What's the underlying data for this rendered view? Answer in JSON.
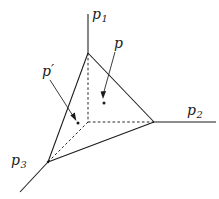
{
  "figure": {
    "kind": "geometric-diagram",
    "background_color": "#ffffff",
    "stroke_color": "#1a1a1a"
  },
  "axes": [
    {
      "id": "p1",
      "base": "p",
      "subscript": "1",
      "orientation": "vertical-up",
      "label_position": {
        "x": 92,
        "y": 7
      }
    },
    {
      "id": "p2",
      "base": "p",
      "subscript": "2",
      "orientation": "horizontal-right",
      "label_position": {
        "x": 187,
        "y": 103
      }
    },
    {
      "id": "p3",
      "base": "p",
      "subscript": "3",
      "orientation": "diagonal-down-left",
      "label_position": {
        "x": 11,
        "y": 153
      }
    }
  ],
  "points": [
    {
      "id": "p",
      "label": "p",
      "prime": false,
      "dot": {
        "x": 104,
        "y": 103
      },
      "label_position": {
        "x": 114,
        "y": 36
      },
      "leader_from": {
        "x": 115,
        "y": 52
      },
      "leader_to": {
        "x": 103,
        "y": 95
      }
    },
    {
      "id": "p-prime",
      "label": "p",
      "prime": true,
      "dot": {
        "x": 78,
        "y": 123
      },
      "label_position": {
        "x": 42,
        "y": 64
      },
      "leader_from": {
        "x": 50,
        "y": 80
      },
      "leader_to": {
        "x": 75,
        "y": 119
      }
    }
  ],
  "vertices": {
    "apex": {
      "x": 88,
      "y": 53
    },
    "right": {
      "x": 154,
      "y": 122
    },
    "bottom_left": {
      "x": 48,
      "y": 162
    },
    "hidden_back": {
      "x": 88,
      "y": 122
    }
  },
  "edges": {
    "solid": [
      {
        "from": "apex",
        "to": "right"
      },
      {
        "from": "apex",
        "to": "bottom_left"
      },
      {
        "from": "right",
        "to": "bottom_left"
      }
    ],
    "dashed": [
      {
        "from": "apex",
        "to": "hidden_back"
      },
      {
        "from": "hidden_back",
        "to": "right"
      },
      {
        "from": "hidden_back",
        "to": "bottom_left"
      }
    ]
  }
}
